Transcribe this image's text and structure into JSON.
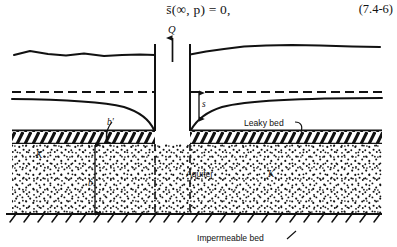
{
  "equation": {
    "text": "s̄(∞, p) = 0,",
    "number": "(7.4-6)"
  },
  "figure": {
    "labels": {
      "discharge": "Q",
      "drawdown": "s",
      "leaky_bed_thickness": "b′",
      "aquifer_thickness": "b",
      "hydraulic_conductivity_left": "K",
      "hydraulic_conductivity_right": "K",
      "aquifer": "Aquifer",
      "leaky_bed": "Leaky bed",
      "impermeable_bed": "Impermeable bed"
    },
    "colors": {
      "ink": "#111111",
      "paper": "#ffffff"
    }
  }
}
